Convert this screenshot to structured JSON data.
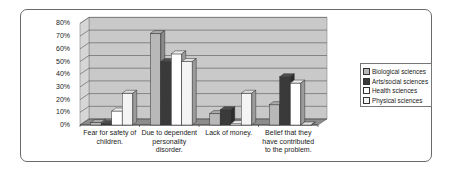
{
  "chart_data": {
    "type": "bar",
    "style": "3d-clustered-column",
    "title": "",
    "xlabel": "",
    "ylabel": "",
    "ylim": [
      0,
      80
    ],
    "y_ticks": [
      "0%",
      "10%",
      "20%",
      "30%",
      "40%",
      "50%",
      "60%",
      "70%",
      "80%"
    ],
    "grid": true,
    "legend_position": "right",
    "categories": [
      "Fear for safety of children.",
      "Due to dependent personality disorder.",
      "Lack of money.",
      "Belief that they have contributed to the problem."
    ],
    "category_lines": [
      [
        "Fear for safety of",
        "children."
      ],
      [
        "Due to dependent",
        "personality",
        "disorder."
      ],
      [
        "Lack of money."
      ],
      [
        "Belief that they",
        "have contributed",
        "to the problem."
      ]
    ],
    "series": [
      {
        "name": "Biological sciences",
        "color": "#b8b8b8",
        "values": [
          2,
          72,
          9,
          16
        ]
      },
      {
        "name": "Arts/social sciences",
        "color": "#3a3a3a",
        "values": [
          1,
          50,
          12,
          38
        ]
      },
      {
        "name": "Health sciences",
        "color": "#ffffff",
        "values": [
          11,
          56,
          1,
          33
        ]
      },
      {
        "name": "Physical sciences",
        "color": "#f4f4f4",
        "values": [
          25,
          50,
          25,
          0
        ]
      }
    ]
  }
}
